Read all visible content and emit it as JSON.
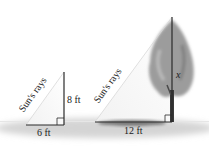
{
  "diagram": {
    "type": "similar-triangles-shadow-problem",
    "small_triangle": {
      "object": "pole",
      "height_label": "8 ft",
      "shadow_label": "6 ft",
      "hypotenuse_label": "Sun's rays"
    },
    "large_triangle": {
      "object": "tree",
      "height_label": "x",
      "shadow_label": "12 ft",
      "hypotenuse_label": "Sun's rays"
    },
    "colors": {
      "line": "#2a2a2a",
      "ground": "#c8c8c8",
      "shadow": "#8a8a8a",
      "tree_foliage": "#9a9a9a",
      "ray": "#d0d0d0"
    }
  }
}
